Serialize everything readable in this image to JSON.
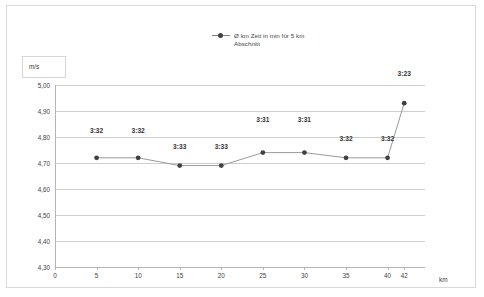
{
  "legend": {
    "marker_icon": "series-marker-icon",
    "label": "Ø km Zeit in min für 5 km\nAbschnitt"
  },
  "axes": {
    "y_unit_label": "m/s",
    "x_title": "km"
  },
  "colors": {
    "series_line": "#9a9a9a",
    "series_marker": "#404040",
    "gridline": "#cfcfcf",
    "axis": "#b5b5b5",
    "text": "#404040",
    "frame": "#d9d9d9"
  },
  "chart_data": {
    "type": "line",
    "title": "",
    "xlabel": "km",
    "ylabel": "m/s",
    "xlim": [
      0,
      44.5
    ],
    "ylim": [
      4.3,
      5.0
    ],
    "grid": true,
    "legend_position": "top-center",
    "x_ticks": [
      "0",
      "5",
      "10",
      "15",
      "20",
      "25",
      "30",
      "35",
      "40",
      "42"
    ],
    "x_tick_values": [
      0,
      5,
      10,
      15,
      20,
      25,
      30,
      35,
      40,
      42
    ],
    "y_ticks": [
      "4,30",
      "4,40",
      "4,50",
      "4,60",
      "4,70",
      "4,80",
      "4,90",
      "5,00"
    ],
    "y_tick_values": [
      4.3,
      4.4,
      4.5,
      4.6,
      4.7,
      4.8,
      4.9,
      5.0
    ],
    "series": [
      {
        "name": "Ø km Zeit in min für 5 km Abschnitt",
        "x": [
          5,
          10,
          15,
          20,
          25,
          30,
          35,
          40,
          42
        ],
        "values": [
          4.72,
          4.72,
          4.69,
          4.69,
          4.74,
          4.74,
          4.72,
          4.72,
          4.93
        ],
        "point_labels": [
          "3:32",
          "3:32",
          "3:33",
          "3:33",
          "3:31",
          "3:31",
          "3:32",
          "3:32",
          "3:23"
        ],
        "label_offsets_px": [
          24,
          24,
          16,
          16,
          30,
          30,
          16,
          16,
          26
        ]
      }
    ]
  }
}
